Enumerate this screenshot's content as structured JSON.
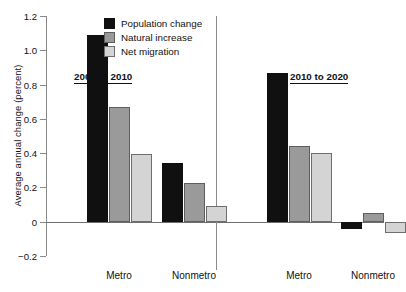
{
  "chart_data": {
    "type": "bar",
    "title": "",
    "xlabel": "",
    "ylabel": "Average annual change (percent)",
    "ylim": [
      -0.2,
      1.2
    ],
    "yticks": [
      "1.2",
      "1.0",
      "0.8",
      "0.6",
      "0.4",
      "0.2",
      "0",
      "−0.2"
    ],
    "ytick_values": [
      1.2,
      1.0,
      0.8,
      0.6,
      0.4,
      0.2,
      0,
      -0.2
    ],
    "grid": false,
    "legend_position": "top-center-left",
    "categories": [
      "Metro",
      "Nonmetro"
    ],
    "panels": [
      {
        "label": "2000 to 2010",
        "categories": [
          "Metro",
          "Nonmetro"
        ],
        "series": [
          {
            "name": "Population change",
            "values": [
              1.09,
              0.34
            ]
          },
          {
            "name": "Natural increase",
            "values": [
              0.67,
              0.225
            ]
          },
          {
            "name": "Net migration",
            "values": [
              0.395,
              0.09
            ]
          }
        ]
      },
      {
        "label": "2010 to 2020",
        "categories": [
          "Metro",
          "Nonmetro"
        ],
        "series": [
          {
            "name": "Population change",
            "values": [
              0.865,
              -0.04
            ]
          },
          {
            "name": "Natural increase",
            "values": [
              0.44,
              0.05
            ]
          },
          {
            "name": "Net migration",
            "values": [
              0.4,
              -0.065
            ]
          }
        ]
      }
    ],
    "legend": [
      {
        "label": "Population change",
        "color": "#101010",
        "key": "pop"
      },
      {
        "label": "Natural increase",
        "color": "#9a9a9a",
        "key": "nat"
      },
      {
        "label": "Net migration",
        "color": "#d4d4d4",
        "key": "net"
      }
    ]
  }
}
